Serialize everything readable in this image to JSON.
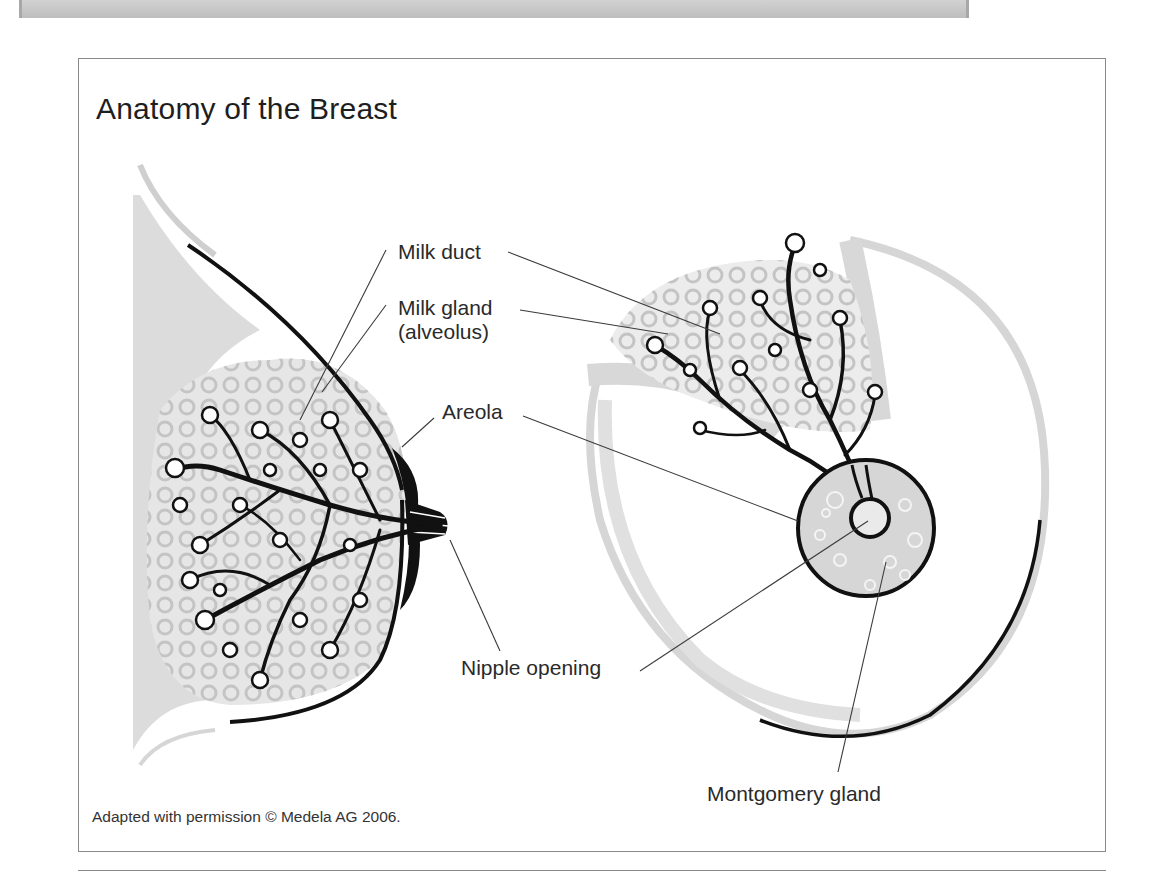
{
  "figure": {
    "title": "Anatomy of the Breast",
    "credit": "Adapted with permission © Medela AG 2006."
  },
  "labels": {
    "milk_duct": "Milk duct",
    "milk_gland_line1": "Milk gland",
    "milk_gland_line2": "(alveolus)",
    "areola": "Areola",
    "nipple_opening": "Nipple opening",
    "montgomery_gland": "Montgomery gland"
  },
  "colors": {
    "ink": "#111111",
    "tissue_grey": "#d4d4d4",
    "frame": "#8a8a8a",
    "text": "#2a2a2a"
  }
}
